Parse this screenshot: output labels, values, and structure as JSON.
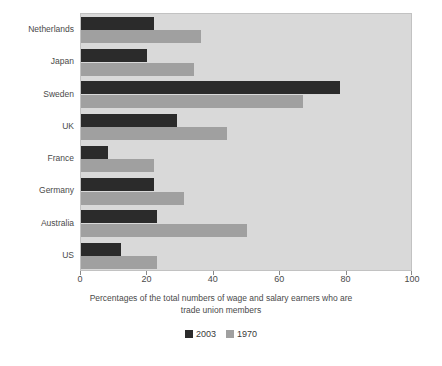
{
  "chart_data": {
    "type": "bar",
    "orientation": "horizontal",
    "title": "",
    "subtitle": "",
    "caption": "Percentages of the total numbers of wage and salary earners who are trade union members",
    "caption_line1": "Percentages of the total numbers of wage and salary earners who are",
    "caption_line2": "trade union members",
    "xlabel": "",
    "ylabel": "",
    "xlim": [
      0,
      100
    ],
    "ylim": null,
    "grid": false,
    "legend_position": "bottom",
    "categories": [
      "Netherlands",
      "Japan",
      "Sweden",
      "UK",
      "France",
      "Germany",
      "Australia",
      "US"
    ],
    "x_ticks": [
      0,
      20,
      40,
      60,
      80,
      100
    ],
    "x_tick_labels": [
      "0",
      "20",
      "40",
      "60",
      "80",
      "100"
    ],
    "series": [
      {
        "name": "2003",
        "color": "#2b2b2b",
        "values": [
          22,
          20,
          78,
          29,
          8,
          22,
          23,
          12
        ]
      },
      {
        "name": "1970",
        "color": "#a0a0a0",
        "values": [
          36,
          34,
          67,
          44,
          22,
          31,
          50,
          23
        ]
      }
    ],
    "plot_background": "#d9d9d9",
    "figure_background": "#ffffff"
  },
  "legend": {
    "items": [
      {
        "label": "2003",
        "color": "#2b2b2b"
      },
      {
        "label": "1970",
        "color": "#a0a0a0"
      }
    ]
  }
}
